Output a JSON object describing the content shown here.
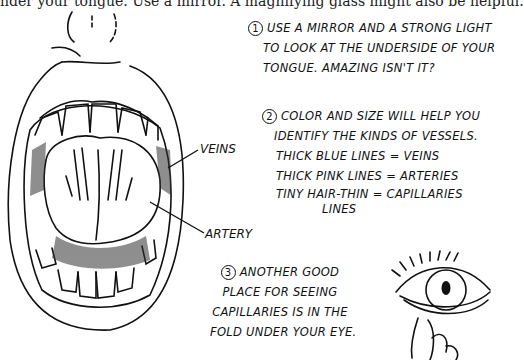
{
  "caption": "nder your tongue.  Use a mirror.  A magnifying glass might also be helpful.",
  "labels": {
    "veins": "VEINS",
    "artery": "ARTERY"
  },
  "notes": [
    {
      "number": "1",
      "lines": [
        "USE A MIRROR AND A STRONG LIGHT",
        "TO LOOK AT THE UNDERSIDE OF YOUR",
        "TONGUE. AMAZING ISN'T IT?"
      ]
    },
    {
      "number": "2",
      "lines": [
        "COLOR AND SIZE WILL HELP YOU",
        "IDENTIFY THE KINDS OF VESSELS.",
        "THICK BLUE LINES = VEINS",
        "THICK PINK LINES = ARTERIES",
        "TINY HAIR-THIN  = CAPILLARIES",
        "LINES"
      ]
    },
    {
      "number": "3",
      "lines": [
        "ANOTHER GOOD",
        "PLACE FOR SEEING",
        "CAPILLARIES IS IN THE",
        "FOLD UNDER YOUR EYE."
      ]
    }
  ],
  "illustrations": {
    "mouth": "open-mouth-tongue-underside-icon",
    "eye": "eye-with-lower-lid-pulled-icon"
  }
}
